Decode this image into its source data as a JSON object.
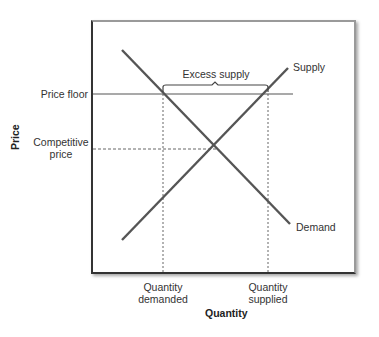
{
  "diagram": {
    "type": "supply-demand-price-floor",
    "axes": {
      "x_label": "Quantity",
      "y_label": "Price"
    },
    "curves": [
      {
        "name": "Supply",
        "label": "Supply",
        "from": [
          122,
          240
        ],
        "to": [
          288,
          68
        ]
      },
      {
        "name": "Demand",
        "label": "Demand",
        "from": [
          122,
          50
        ],
        "to": [
          290,
          224
        ]
      }
    ],
    "price_levels": {
      "price_floor": {
        "label": "Price floor",
        "y": 94
      },
      "competitive_price": {
        "label_line1": "Competitive",
        "label_line2": "price",
        "y": 149
      }
    },
    "quantities": {
      "quantity_demanded": {
        "label_line1": "Quantity",
        "label_line2": "demanded",
        "x": 163
      },
      "quantity_supplied": {
        "label_line1": "Quantity",
        "label_line2": "supplied",
        "x": 268
      }
    },
    "annotation": {
      "bracket_label": "Excess supply"
    },
    "colors": {
      "lines": "#555555",
      "text": "#333333",
      "dashed": "#666666"
    }
  }
}
